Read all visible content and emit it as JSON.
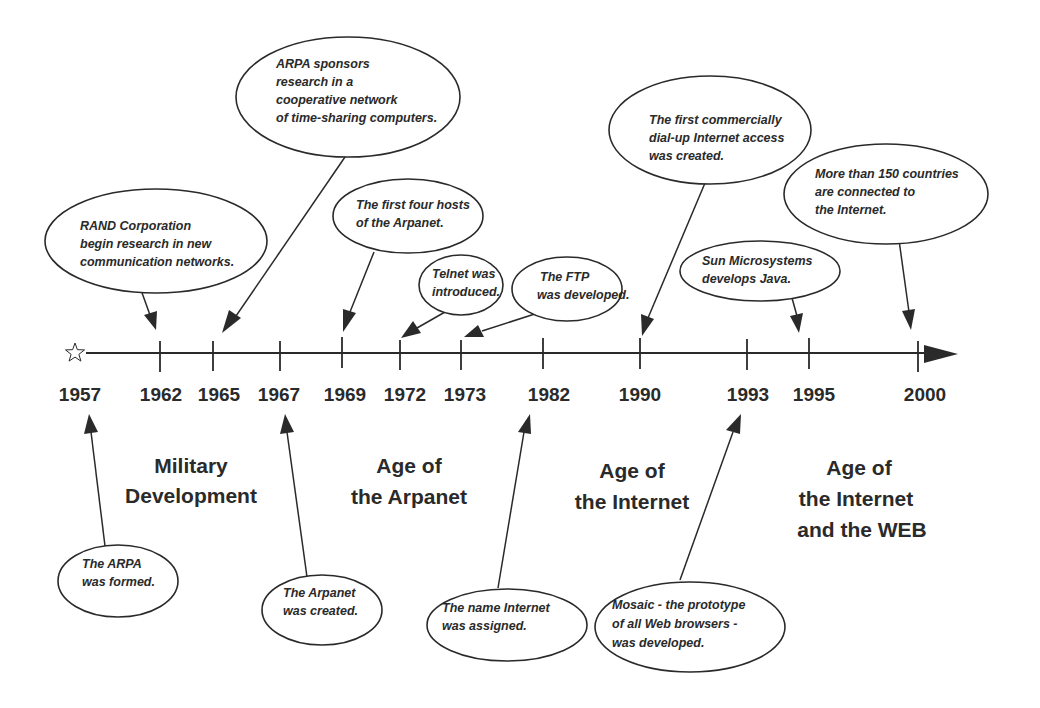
{
  "diagram": {
    "type": "timeline",
    "title": "",
    "start_marker": "star-icon",
    "colors": {
      "ink": "#2a2a2a",
      "background": "#ffffff"
    },
    "years": [
      {
        "label": "1957",
        "x": 78,
        "tick": false
      },
      {
        "label": "1962",
        "x": 160,
        "tick": true
      },
      {
        "label": "1965",
        "x": 213,
        "tick": true
      },
      {
        "label": "1967",
        "x": 280,
        "tick": true
      },
      {
        "label": "1969",
        "x": 342,
        "tick": true
      },
      {
        "label": "1972",
        "x": 400,
        "tick": true
      },
      {
        "label": "1973",
        "x": 461,
        "tick": true
      },
      {
        "label": "1982",
        "x": 543,
        "tick": true
      },
      {
        "label": "1990",
        "x": 640,
        "tick": true
      },
      {
        "label": "1993",
        "x": 747,
        "tick": true
      },
      {
        "label": "1995",
        "x": 809,
        "tick": true
      },
      {
        "label": "2000",
        "x": 918,
        "tick": true
      }
    ],
    "eras": [
      {
        "lines": [
          "Military",
          "Development"
        ]
      },
      {
        "lines": [
          "Age of",
          "the Arpanet"
        ]
      },
      {
        "lines": [
          "Age of",
          "the Internet"
        ]
      },
      {
        "lines": [
          "Age of",
          "the Internet",
          "and the WEB"
        ]
      }
    ],
    "events_above": [
      {
        "year": "1962",
        "lines": [
          "RAND Corporation",
          "begin research in new",
          "communication networks."
        ]
      },
      {
        "year": "1965",
        "lines": [
          "ARPA sponsors",
          "research in a",
          "cooperative network",
          "of time-sharing computers."
        ]
      },
      {
        "year": "1969",
        "lines": [
          "The first four hosts",
          "of the Arpanet."
        ]
      },
      {
        "year": "1972",
        "lines": [
          "Telnet was",
          "introduced."
        ]
      },
      {
        "year": "1973",
        "lines": [
          "The FTP",
          "was developed."
        ]
      },
      {
        "year": "1990",
        "lines": [
          "The first commercially",
          "dial-up Internet access",
          "was created."
        ]
      },
      {
        "year": "1995",
        "lines": [
          "Sun Microsystems",
          "develops Java."
        ]
      },
      {
        "year": "2000",
        "lines": [
          "More than 150 countries",
          "are connected to",
          "the Internet."
        ]
      }
    ],
    "events_below": [
      {
        "year": "1957",
        "lines": [
          "The ARPA",
          "was formed."
        ]
      },
      {
        "year": "1967",
        "lines": [
          "The Arpanet",
          "was created."
        ]
      },
      {
        "year": "1982",
        "lines": [
          "The name Internet",
          "was assigned."
        ]
      },
      {
        "year": "1993",
        "lines": [
          "Mosaic - the prototype",
          "of all Web browsers -",
          "was developed."
        ]
      }
    ]
  }
}
